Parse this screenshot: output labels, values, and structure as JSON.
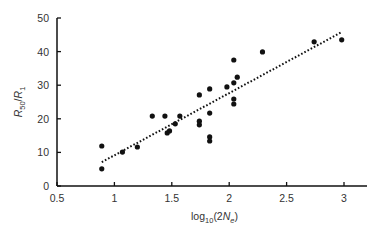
{
  "chart_data": {
    "type": "scatter",
    "title": "",
    "xlabel": {
      "base": "log",
      "sub": "10",
      "mid": "(2",
      "ital": "N",
      "sub2": "e",
      "end": ")"
    },
    "ylabel": {
      "ital1": "R",
      "sub1": "50",
      "slash": "/",
      "ital2": "R",
      "sub2": "1"
    },
    "xlim": [
      0.5,
      3.0
    ],
    "ylim": [
      0,
      50
    ],
    "xticks": [
      0.5,
      1,
      1.5,
      2,
      2.5,
      3
    ],
    "xtick_labels": [
      "0.5",
      "1",
      "1.5",
      "2",
      "2.5",
      "3"
    ],
    "yticks": [
      0,
      10,
      20,
      30,
      40,
      50
    ],
    "ytick_labels": [
      "0",
      "10",
      "20",
      "30",
      "40",
      "50"
    ],
    "grid": false,
    "series": [
      {
        "name": "observations",
        "marker": "filled-circle",
        "color": "#111111",
        "points": [
          [
            0.89,
            11.9
          ],
          [
            0.89,
            5.1
          ],
          [
            1.07,
            10.1
          ],
          [
            1.2,
            11.6
          ],
          [
            1.33,
            20.8
          ],
          [
            1.44,
            20.8
          ],
          [
            1.46,
            15.8
          ],
          [
            1.48,
            16.4
          ],
          [
            1.53,
            18.5
          ],
          [
            1.57,
            20.8
          ],
          [
            1.74,
            27.1
          ],
          [
            1.74,
            19.3
          ],
          [
            1.74,
            18.2
          ],
          [
            1.83,
            28.9
          ],
          [
            1.83,
            21.7
          ],
          [
            1.83,
            14.6
          ],
          [
            1.83,
            13.4
          ],
          [
            1.98,
            29.5
          ],
          [
            2.04,
            30.7
          ],
          [
            2.04,
            37.5
          ],
          [
            2.07,
            32.4
          ],
          [
            2.04,
            25.9
          ],
          [
            2.04,
            24.4
          ],
          [
            2.29,
            39.9
          ],
          [
            2.74,
            42.9
          ],
          [
            2.98,
            43.5
          ]
        ]
      }
    ],
    "trendline": {
      "name": "linear-fit",
      "style": "dotted",
      "color": "#111111",
      "from": [
        0.89,
        7.1
      ],
      "to": [
        2.98,
        45.8
      ]
    }
  }
}
